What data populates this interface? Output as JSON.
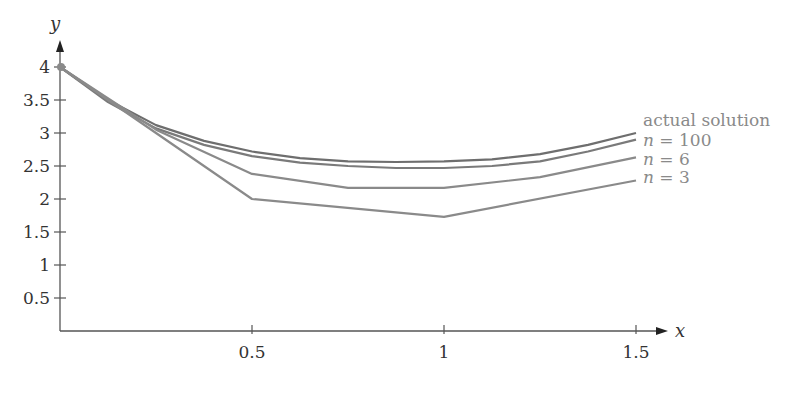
{
  "chart_data": {
    "type": "line",
    "title": "",
    "xlabel": "x",
    "ylabel": "y",
    "xlim": [
      0,
      1.55
    ],
    "ylim": [
      0,
      4.2
    ],
    "x_ticks": [
      0.5,
      1,
      1.5
    ],
    "x_tick_labels": [
      "0.5",
      "1",
      "1.5"
    ],
    "y_ticks": [
      0.5,
      1,
      1.5,
      2,
      2.5,
      3,
      3.5,
      4
    ],
    "y_tick_labels": [
      "0.5",
      "1",
      "1.5",
      "2",
      "2.5",
      "3",
      "3.5",
      "4"
    ],
    "grid": false,
    "legend_position": "right, inline at line ends",
    "series": [
      {
        "name": "actual solution",
        "color": "#6e6e6e",
        "x": [
          0,
          0.125,
          0.25,
          0.375,
          0.5,
          0.625,
          0.75,
          0.875,
          1,
          1.125,
          1.25,
          1.375,
          1.5
        ],
        "y": [
          4.0,
          3.5,
          3.12,
          2.88,
          2.72,
          2.62,
          2.57,
          2.56,
          2.57,
          2.6,
          2.68,
          2.82,
          3.0
        ]
      },
      {
        "name": "n = 100",
        "color": "#7a7a7a",
        "x": [
          0,
          0.125,
          0.25,
          0.375,
          0.5,
          0.625,
          0.75,
          0.875,
          1,
          1.125,
          1.25,
          1.375,
          1.5
        ],
        "y": [
          4.0,
          3.47,
          3.07,
          2.82,
          2.65,
          2.55,
          2.5,
          2.47,
          2.47,
          2.5,
          2.57,
          2.72,
          2.9
        ]
      },
      {
        "name": "n = 6",
        "color": "#8a8a8a",
        "x": [
          0,
          0.25,
          0.5,
          0.75,
          1,
          1.25,
          1.5
        ],
        "y": [
          4.0,
          3.05,
          2.38,
          2.17,
          2.17,
          2.33,
          2.63
        ]
      },
      {
        "name": "n = 3",
        "color": "#8a8a8a",
        "x": [
          0,
          0.5,
          1,
          1.5
        ],
        "y": [
          4.0,
          2.0,
          1.73,
          2.28
        ]
      }
    ],
    "annotations": [
      "starting point marker at (0, 4)"
    ]
  },
  "legend": {
    "actual": "actual solution",
    "n100_var": "n",
    "n100_val": " = 100",
    "n6_var": "n",
    "n6_val": " = 6",
    "n3_var": "n",
    "n3_val": " = 3"
  },
  "axes": {
    "x_label": "x",
    "y_label": "y",
    "x_tick_labels": [
      "0.5",
      "1",
      "1.5"
    ],
    "y_tick_labels": [
      "0.5",
      "1",
      "1.5",
      "2",
      "2.5",
      "3",
      "3.5",
      "4"
    ]
  }
}
